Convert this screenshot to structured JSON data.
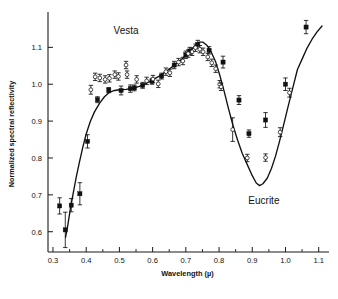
{
  "figure": {
    "background": "#ffffff",
    "ink_color": "#111111"
  },
  "annotations": {
    "vesta_label": "Vesta",
    "eucrite_label": "Eucrite"
  },
  "axes": {
    "x_title": "Wavelength (µ)",
    "y_title": "Normalized spectral reflectivity",
    "x_ticklabels": [
      "0.3",
      "0.4",
      "0.5",
      "0.6",
      "0.7",
      "0.8",
      "0.9",
      "1.0",
      "1.1"
    ],
    "y_ticklabels": [
      "0.6",
      "0.7",
      "0.8",
      "0.9",
      "1.0",
      "1.1"
    ]
  },
  "chart_data": {
    "type": "scatter",
    "title": "",
    "subtitle": "",
    "xlabel": "Wavelength (µ)",
    "ylabel": "Normalized spectral reflectivity",
    "xlim": [
      0.285,
      1.125
    ],
    "ylim": [
      0.545,
      1.185
    ],
    "xticks": [
      0.3,
      0.4,
      0.5,
      0.6,
      0.7,
      0.8,
      0.9,
      1.0,
      1.1
    ],
    "yticks": [
      0.6,
      0.7,
      0.8,
      0.9,
      1.0,
      1.1
    ],
    "x_minor_ticks": [
      0.35,
      0.45,
      0.55,
      0.65,
      0.75,
      0.85,
      0.95,
      1.05
    ],
    "grid": false,
    "legend": "none",
    "legend_position": "none",
    "annotations": [
      {
        "text": "Vesta",
        "x": 0.52,
        "y": 1.135
      },
      {
        "text": "Eucrite",
        "x": 0.935,
        "y": 0.675
      }
    ],
    "series": [
      {
        "name": "Vesta",
        "marker": "filled-square",
        "has_error_bars": true,
        "points": [
          {
            "x": 0.32,
            "y": 0.67,
            "err": 0.022
          },
          {
            "x": 0.337,
            "y": 0.605,
            "err": 0.048
          },
          {
            "x": 0.355,
            "y": 0.672,
            "err": 0.018
          },
          {
            "x": 0.381,
            "y": 0.703,
            "err": 0.03
          },
          {
            "x": 0.404,
            "y": 0.845,
            "err": 0.018
          },
          {
            "x": 0.434,
            "y": 0.958,
            "err": 0.008
          },
          {
            "x": 0.468,
            "y": 0.984,
            "err": 0.007
          },
          {
            "x": 0.505,
            "y": 0.983,
            "err": 0.012
          },
          {
            "x": 0.533,
            "y": 0.988,
            "err": 0.01
          },
          {
            "x": 0.545,
            "y": 0.99,
            "err": 0.008
          },
          {
            "x": 0.57,
            "y": 0.997,
            "err": 0.008
          },
          {
            "x": 0.598,
            "y": 1.008,
            "err": 0.008
          },
          {
            "x": 0.627,
            "y": 1.022,
            "err": 0.008
          },
          {
            "x": 0.665,
            "y": 1.052,
            "err": 0.01
          },
          {
            "x": 0.7,
            "y": 1.08,
            "err": 0.01
          },
          {
            "x": 0.712,
            "y": 1.09,
            "err": 0.01
          },
          {
            "x": 0.736,
            "y": 1.108,
            "err": 0.011
          },
          {
            "x": 0.77,
            "y": 1.092,
            "err": 0.01
          },
          {
            "x": 0.812,
            "y": 1.06,
            "err": 0.016
          },
          {
            "x": 0.86,
            "y": 0.957,
            "err": 0.012
          },
          {
            "x": 0.89,
            "y": 0.866,
            "err": 0.01
          },
          {
            "x": 0.94,
            "y": 0.903,
            "err": 0.02
          },
          {
            "x": 1.0,
            "y": 1.0,
            "err": 0.017
          },
          {
            "x": 1.062,
            "y": 1.155,
            "err": 0.018
          }
        ]
      },
      {
        "name": "Eucrite",
        "marker": "open-circle",
        "has_error_bars": false,
        "points": [
          {
            "x": 0.414,
            "y": 0.985,
            "err": 0.012
          },
          {
            "x": 0.427,
            "y": 1.02,
            "err": 0.01
          },
          {
            "x": 0.441,
            "y": 1.017,
            "err": 0.01
          },
          {
            "x": 0.457,
            "y": 1.013,
            "err": 0.01
          },
          {
            "x": 0.47,
            "y": 1.016,
            "err": 0.01
          },
          {
            "x": 0.486,
            "y": 1.026,
            "err": 0.01
          },
          {
            "x": 0.497,
            "y": 1.021,
            "err": 0.01
          },
          {
            "x": 0.52,
            "y": 1.052,
            "err": 0.01
          },
          {
            "x": 0.523,
            "y": 1.026,
            "err": 0.01
          },
          {
            "x": 0.552,
            "y": 1.013,
            "err": 0.01
          },
          {
            "x": 0.582,
            "y": 1.009,
            "err": 0.01
          },
          {
            "x": 0.601,
            "y": 1.014,
            "err": 0.01
          },
          {
            "x": 0.617,
            "y": 1.001,
            "err": 0.01
          },
          {
            "x": 0.64,
            "y": 1.034,
            "err": 0.01
          },
          {
            "x": 0.652,
            "y": 1.031,
            "err": 0.01
          },
          {
            "x": 0.678,
            "y": 1.06,
            "err": 0.01
          },
          {
            "x": 0.691,
            "y": 1.063,
            "err": 0.01
          },
          {
            "x": 0.707,
            "y": 1.083,
            "err": 0.01
          },
          {
            "x": 0.719,
            "y": 1.088,
            "err": 0.01
          },
          {
            "x": 0.729,
            "y": 1.099,
            "err": 0.01
          },
          {
            "x": 0.742,
            "y": 1.095,
            "err": 0.01
          },
          {
            "x": 0.752,
            "y": 1.088,
            "err": 0.01
          },
          {
            "x": 0.766,
            "y": 1.074,
            "err": 0.01
          },
          {
            "x": 0.778,
            "y": 1.058,
            "err": 0.01
          },
          {
            "x": 0.79,
            "y": 1.042,
            "err": 0.01
          },
          {
            "x": 0.802,
            "y": 1.0,
            "err": 0.01
          },
          {
            "x": 0.806,
            "y": 0.993,
            "err": 0.01
          },
          {
            "x": 0.841,
            "y": 0.877,
            "err": 0.032
          },
          {
            "x": 0.885,
            "y": 0.8,
            "err": 0.01
          },
          {
            "x": 0.94,
            "y": 0.801,
            "err": 0.01
          },
          {
            "x": 0.984,
            "y": 0.87,
            "err": 0.012
          },
          {
            "x": 1.012,
            "y": 0.977,
            "err": 0.012
          }
        ]
      }
    ],
    "fit_curve": {
      "name": "Eucrite reflectance curve",
      "style": "solid",
      "points": [
        {
          "x": 0.338,
          "y": 0.585
        },
        {
          "x": 0.345,
          "y": 0.62
        },
        {
          "x": 0.352,
          "y": 0.66
        },
        {
          "x": 0.36,
          "y": 0.7
        },
        {
          "x": 0.37,
          "y": 0.748
        },
        {
          "x": 0.38,
          "y": 0.79
        },
        {
          "x": 0.39,
          "y": 0.83
        },
        {
          "x": 0.4,
          "y": 0.865
        },
        {
          "x": 0.412,
          "y": 0.898
        },
        {
          "x": 0.425,
          "y": 0.925
        },
        {
          "x": 0.44,
          "y": 0.948
        },
        {
          "x": 0.455,
          "y": 0.966
        },
        {
          "x": 0.47,
          "y": 0.978
        },
        {
          "x": 0.485,
          "y": 0.983
        },
        {
          "x": 0.5,
          "y": 0.985
        },
        {
          "x": 0.52,
          "y": 0.986
        },
        {
          "x": 0.54,
          "y": 0.989
        },
        {
          "x": 0.56,
          "y": 0.994
        },
        {
          "x": 0.58,
          "y": 1.002
        },
        {
          "x": 0.6,
          "y": 1.012
        },
        {
          "x": 0.62,
          "y": 1.022
        },
        {
          "x": 0.64,
          "y": 1.034
        },
        {
          "x": 0.66,
          "y": 1.048
        },
        {
          "x": 0.68,
          "y": 1.062
        },
        {
          "x": 0.7,
          "y": 1.078
        },
        {
          "x": 0.715,
          "y": 1.092
        },
        {
          "x": 0.728,
          "y": 1.105
        },
        {
          "x": 0.74,
          "y": 1.114
        },
        {
          "x": 0.752,
          "y": 1.114
        },
        {
          "x": 0.764,
          "y": 1.105
        },
        {
          "x": 0.776,
          "y": 1.088
        },
        {
          "x": 0.79,
          "y": 1.06
        },
        {
          "x": 0.802,
          "y": 1.025
        },
        {
          "x": 0.815,
          "y": 0.982
        },
        {
          "x": 0.828,
          "y": 0.935
        },
        {
          "x": 0.842,
          "y": 0.888
        },
        {
          "x": 0.856,
          "y": 0.848
        },
        {
          "x": 0.87,
          "y": 0.812
        },
        {
          "x": 0.885,
          "y": 0.782
        },
        {
          "x": 0.9,
          "y": 0.752
        },
        {
          "x": 0.912,
          "y": 0.732
        },
        {
          "x": 0.922,
          "y": 0.725
        },
        {
          "x": 0.932,
          "y": 0.73
        },
        {
          "x": 0.945,
          "y": 0.745
        },
        {
          "x": 0.958,
          "y": 0.772
        },
        {
          "x": 0.97,
          "y": 0.805
        },
        {
          "x": 0.982,
          "y": 0.845
        },
        {
          "x": 0.995,
          "y": 0.892
        },
        {
          "x": 1.008,
          "y": 0.94
        },
        {
          "x": 1.022,
          "y": 0.99
        },
        {
          "x": 1.036,
          "y": 1.04
        },
        {
          "x": 1.05,
          "y": 1.068
        },
        {
          "x": 1.065,
          "y": 1.098
        },
        {
          "x": 1.08,
          "y": 1.122
        },
        {
          "x": 1.095,
          "y": 1.142
        },
        {
          "x": 1.11,
          "y": 1.158
        }
      ]
    }
  }
}
